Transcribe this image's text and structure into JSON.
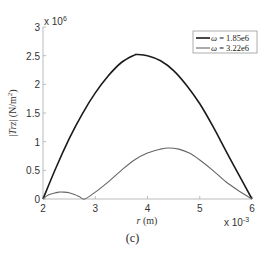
{
  "chart_data": {
    "type": "line",
    "title": "",
    "caption": "(c)",
    "xlabel": "r (m)",
    "ylabel": "|Trz| (N/m²)",
    "x_scale_label": "x 10",
    "x_scale_exp": "-3",
    "y_scale_label": "x 10",
    "y_scale_exp": "6",
    "xlim": [
      2,
      6
    ],
    "ylim": [
      0,
      3
    ],
    "x_ticks": [
      2,
      3,
      4,
      5,
      6
    ],
    "y_ticks": [
      0,
      0.5,
      1,
      1.5,
      2,
      2.5,
      3
    ],
    "y_tick_labels": [
      "0",
      "0.5",
      "1",
      "1.5",
      "2",
      "2.5",
      "3"
    ],
    "x_units_note": "r in units of 1e-3 m; values in units of 1e6 N/m²",
    "grid": false,
    "legend_position": "upper right",
    "series": [
      {
        "name": "ω = 1.85e6",
        "color": "#1a1a1a",
        "width": 1.6,
        "x": [
          2.0,
          2.25,
          2.5,
          2.75,
          3.0,
          3.25,
          3.5,
          3.75,
          3.8,
          4.0,
          4.25,
          4.5,
          4.75,
          5.0,
          5.25,
          5.5,
          5.75,
          6.0
        ],
        "y": [
          0.0,
          0.55,
          1.05,
          1.48,
          1.85,
          2.15,
          2.38,
          2.51,
          2.52,
          2.5,
          2.41,
          2.24,
          1.98,
          1.66,
          1.27,
          0.84,
          0.42,
          0.0
        ]
      },
      {
        "name": "ω = 3.22e6",
        "color": "#666666",
        "width": 1.1,
        "x": [
          2.0,
          2.1,
          2.2,
          2.3,
          2.4,
          2.5,
          2.6,
          2.7,
          2.8,
          3.0,
          3.25,
          3.5,
          3.75,
          4.0,
          4.25,
          4.4,
          4.6,
          4.8,
          5.0,
          5.25,
          5.5,
          5.75,
          6.0
        ],
        "y": [
          0.0,
          0.07,
          0.1,
          0.12,
          0.12,
          0.11,
          0.08,
          0.04,
          0.0,
          0.12,
          0.3,
          0.5,
          0.68,
          0.8,
          0.87,
          0.89,
          0.87,
          0.8,
          0.68,
          0.5,
          0.3,
          0.14,
          0.0
        ]
      }
    ]
  },
  "legend": {
    "items": [
      {
        "label": "ω = 1.85e6"
      },
      {
        "label": "ω = 3.22e6"
      }
    ]
  }
}
